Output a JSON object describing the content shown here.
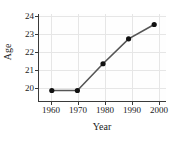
{
  "chart_data": {
    "type": "line",
    "title": "",
    "xlabel": "Year",
    "ylabel": "Age",
    "x": [
      1960,
      1970,
      1980,
      1990,
      2000
    ],
    "values": [
      20.0,
      20.0,
      21.4,
      22.7,
      23.45
    ],
    "series": [
      {
        "name": "Age",
        "values": [
          20.0,
          20.0,
          21.4,
          22.7,
          23.45
        ]
      }
    ],
    "xticks": [
      "1960",
      "1970",
      "1980",
      "1990",
      "2000"
    ],
    "yticks": [
      "20",
      "21",
      "22",
      "23",
      "24"
    ],
    "xlim": [
      1955,
      2005
    ],
    "ylim": [
      19.4,
      24.0
    ],
    "grid": true,
    "legend": "none",
    "marker": "filled-circle",
    "line_color": "#555555",
    "marker_color": "#111111",
    "grid_color": "#e6e6e6",
    "axis_color": "#3a3a3a",
    "background_color": "#ffffff"
  }
}
